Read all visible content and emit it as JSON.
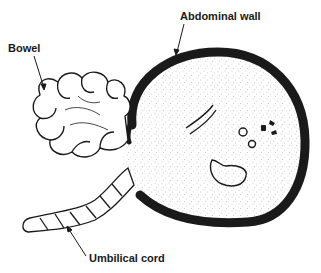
{
  "figure": {
    "type": "anatomical-illustration",
    "labels": {
      "bowel": "Bowel",
      "abdominal_wall": "Abdominal wall",
      "umbilical_cord": "Umbilical cord"
    }
  },
  "colors": {
    "background": "#ffffff",
    "ink": "#1a1a1a",
    "stipple": "#9a9a9a"
  }
}
